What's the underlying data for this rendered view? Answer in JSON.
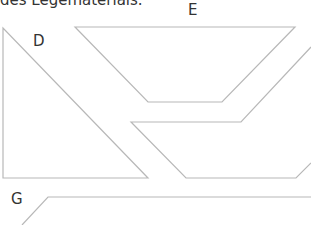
{
  "caption": "des Legematerials.",
  "labels": {
    "d": "D",
    "e": "E",
    "g": "G"
  },
  "colors": {
    "stroke": "#b8b8b8",
    "text": "#333333",
    "background": "#ffffff"
  },
  "shapes": {
    "d": {
      "type": "triangle",
      "points": "3,28 3,178 148,178"
    },
    "e": {
      "type": "trapezoid",
      "points": "75,27 295,27 222,102 148,102"
    },
    "middle": {
      "type": "partial-parallelogram",
      "points": "311,47 241,122 131,122 186,178 296,178 311,163"
    },
    "g": {
      "type": "partial-shape",
      "points": "22,225 48,197 311,197"
    }
  }
}
